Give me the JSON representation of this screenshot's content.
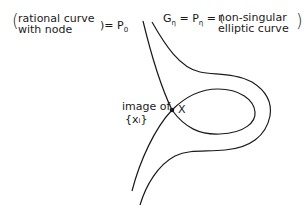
{
  "figure": {
    "left_label": {
      "line1": "rational curve",
      "line2": "with node",
      "equals": ")= P",
      "subscript": "0"
    },
    "right_label": {
      "G": "G",
      "G_sub": "η",
      "eq1": " = P",
      "P_sub": "η",
      "eq2": " = (",
      "line1": "non-singular",
      "line2": "elliptic curve",
      "close": ")"
    },
    "node_label": "X",
    "image_label": {
      "line1": "image of",
      "line2": "{xᵢ}"
    },
    "stroke_color": "#1a1a1a"
  }
}
